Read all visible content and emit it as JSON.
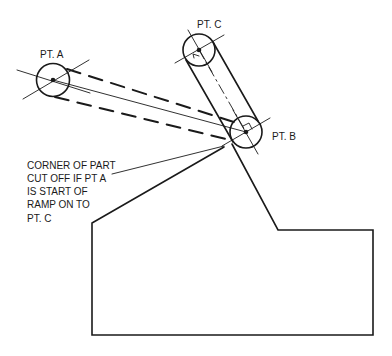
{
  "diagram": {
    "type": "technical drawing - ramp / tool path",
    "points": [
      {
        "id": "A",
        "label": "PT. A"
      },
      {
        "id": "B",
        "label": "PT. B"
      },
      {
        "id": "C",
        "label": "PT. C"
      }
    ],
    "note_lines": [
      "CORNER OF PART",
      "CUT OFF IF PT A",
      "IS START OF",
      "RAMP ON TO",
      "PT. C"
    ],
    "colors": {
      "line": "#1a1a1a",
      "background": "#ffffff"
    }
  }
}
